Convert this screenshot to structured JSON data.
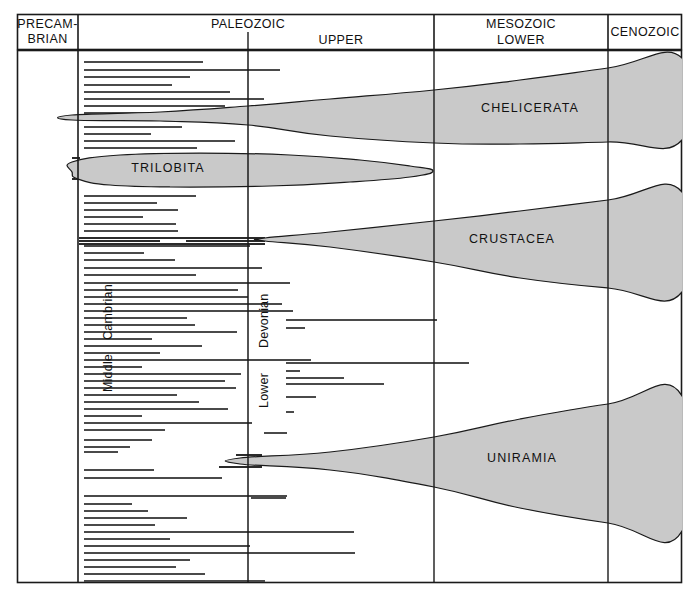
{
  "figure": {
    "background_color": "#ffffff",
    "shape_fill_color": "#c9c9c9",
    "line_color": "#1a1a1a",
    "width": 699,
    "height": 597
  },
  "header": {
    "columns": [
      {
        "name": "precambrian",
        "lines": [
          "PRECAM-",
          "BRIAN"
        ]
      },
      {
        "name": "paleozoic",
        "lines": [
          "PALEOZOIC"
        ]
      },
      {
        "name": "upper",
        "lines": [
          "UPPER"
        ]
      },
      {
        "name": "mesozoic",
        "lines": [
          "MESOZOIC",
          "LOWER"
        ]
      },
      {
        "name": "cenozoic",
        "lines": [
          "CENOZOIC"
        ]
      }
    ]
  },
  "period_labels": [
    {
      "name": "cambrian",
      "text": "Cambrian"
    },
    {
      "name": "middle",
      "text": "Middle"
    },
    {
      "name": "devonian",
      "text": "Devonian"
    },
    {
      "name": "lower",
      "text": "Lower"
    }
  ],
  "taxa": [
    {
      "name": "chelicerata",
      "label": "CHELICERATA"
    },
    {
      "name": "trilobita",
      "label": "TRILOBITA"
    },
    {
      "name": "crustacea",
      "label": "CRUSTACEA"
    },
    {
      "name": "uniramia",
      "label": "UNIRAMIA"
    }
  ],
  "chart_data": {
    "type": "range-chart",
    "xlabel": "",
    "ylabel": "",
    "grid": false,
    "legend": "none",
    "axis_columns": [
      {
        "label": "PRECAMBRIAN",
        "x_start": 17,
        "x_end": 78
      },
      {
        "label": "PALEOZOIC",
        "x_start": 78,
        "x_end": 434
      },
      {
        "label": "UPPER",
        "x_start": 248,
        "x_end": 434
      },
      {
        "label": "MESOZOIC / LOWER",
        "x_start": 434,
        "x_end": 608
      },
      {
        "label": "CENOZOIC",
        "x_start": 608,
        "x_end": 682
      }
    ],
    "vertical_dividers_x": [
      78,
      248,
      434,
      608
    ],
    "taxon_bands": [
      {
        "name": "CHELICERATA",
        "label_x": 530,
        "label_y": 112,
        "description": "Wedge widening from a narrow origin in Cambrian to wide at Cenozoic",
        "outline": [
          [
            72,
            115
          ],
          [
            160,
            112
          ],
          [
            248,
            106
          ],
          [
            330,
            99
          ],
          [
            434,
            90
          ],
          [
            520,
            80
          ],
          [
            608,
            68
          ],
          [
            682,
            58
          ],
          [
            682,
            140
          ],
          [
            608,
            142
          ],
          [
            520,
            144
          ],
          [
            434,
            143
          ],
          [
            330,
            136
          ],
          [
            248,
            125
          ],
          [
            160,
            121
          ],
          [
            72,
            120
          ]
        ]
      },
      {
        "name": "TRILOBITA",
        "label_x": 168,
        "label_y": 172,
        "description": "Lens/leaf shape beginning in Cambrian and tapering out in Upper Paleozoic",
        "outline": [
          [
            72,
            162
          ],
          [
            120,
            155
          ],
          [
            200,
            153
          ],
          [
            290,
            155
          ],
          [
            360,
            160
          ],
          [
            410,
            166
          ],
          [
            433,
            171
          ],
          [
            410,
            177
          ],
          [
            350,
            182
          ],
          [
            270,
            186
          ],
          [
            170,
            187
          ],
          [
            110,
            185
          ],
          [
            78,
            179
          ],
          [
            72,
            172
          ]
        ]
      },
      {
        "name": "CRUSTACEA",
        "label_x": 512,
        "label_y": 243,
        "description": "Wedge originating at a point in Cambrian, widening toward Cenozoic",
        "outline": [
          [
            265,
            238
          ],
          [
            330,
            232
          ],
          [
            434,
            221
          ],
          [
            520,
            211
          ],
          [
            608,
            200
          ],
          [
            682,
            192
          ],
          [
            682,
            292
          ],
          [
            608,
            288
          ],
          [
            520,
            278
          ],
          [
            434,
            262
          ],
          [
            330,
            247
          ],
          [
            265,
            241
          ]
        ]
      },
      {
        "name": "UNIRAMIA",
        "label_x": 522,
        "label_y": 462,
        "description": "Wedge originating near Devonian, broadly expanding to Cenozoic",
        "outline": [
          [
            240,
            458
          ],
          [
            330,
            452
          ],
          [
            434,
            437
          ],
          [
            520,
            419
          ],
          [
            608,
            404
          ],
          [
            682,
            396
          ],
          [
            682,
            531
          ],
          [
            608,
            523
          ],
          [
            520,
            508
          ],
          [
            434,
            487
          ],
          [
            330,
            470
          ],
          [
            240,
            464
          ]
        ]
      }
    ],
    "range_lines": [
      {
        "y": 62,
        "x_start": 84,
        "x_end": 203
      },
      {
        "y": 70,
        "x_start": 84,
        "x_end": 280
      },
      {
        "y": 77,
        "x_start": 84,
        "x_end": 190
      },
      {
        "y": 85,
        "x_start": 84,
        "x_end": 172
      },
      {
        "y": 92,
        "x_start": 84,
        "x_end": 230
      },
      {
        "y": 99,
        "x_start": 84,
        "x_end": 264
      },
      {
        "y": 106,
        "x_start": 84,
        "x_end": 225
      },
      {
        "y": 113,
        "x_start": 84,
        "x_end": 250
      },
      {
        "y": 127,
        "x_start": 84,
        "x_end": 182
      },
      {
        "y": 134,
        "x_start": 84,
        "x_end": 151
      },
      {
        "y": 141,
        "x_start": 84,
        "x_end": 235
      },
      {
        "y": 148,
        "x_start": 84,
        "x_end": 197
      },
      {
        "y": 196,
        "x_start": 84,
        "x_end": 196
      },
      {
        "y": 203,
        "x_start": 84,
        "x_end": 157
      },
      {
        "y": 210,
        "x_start": 84,
        "x_end": 178
      },
      {
        "y": 217,
        "x_start": 84,
        "x_end": 143
      },
      {
        "y": 224,
        "x_start": 84,
        "x_end": 176
      },
      {
        "y": 231,
        "x_start": 84,
        "x_end": 178
      },
      {
        "y": 246,
        "x_start": 84,
        "x_end": 250
      },
      {
        "y": 253,
        "x_start": 84,
        "x_end": 144
      },
      {
        "y": 260,
        "x_start": 84,
        "x_end": 175
      },
      {
        "y": 268,
        "x_start": 84,
        "x_end": 262
      },
      {
        "y": 275,
        "x_start": 84,
        "x_end": 196
      },
      {
        "y": 283,
        "x_start": 84,
        "x_end": 290
      },
      {
        "y": 290,
        "x_start": 84,
        "x_end": 238
      },
      {
        "y": 297,
        "x_start": 84,
        "x_end": 248
      },
      {
        "y": 304,
        "x_start": 84,
        "x_end": 282
      },
      {
        "y": 311,
        "x_start": 84,
        "x_end": 293
      },
      {
        "y": 318,
        "x_start": 84,
        "x_end": 187
      },
      {
        "y": 320,
        "x_start": 286,
        "x_end": 437
      },
      {
        "y": 325,
        "x_start": 84,
        "x_end": 195
      },
      {
        "y": 328,
        "x_start": 286,
        "x_end": 305
      },
      {
        "y": 332,
        "x_start": 84,
        "x_end": 237
      },
      {
        "y": 339,
        "x_start": 84,
        "x_end": 152
      },
      {
        "y": 346,
        "x_start": 84,
        "x_end": 202
      },
      {
        "y": 353,
        "x_start": 84,
        "x_end": 160
      },
      {
        "y": 360,
        "x_start": 84,
        "x_end": 311
      },
      {
        "y": 363,
        "x_start": 286,
        "x_end": 469
      },
      {
        "y": 367,
        "x_start": 84,
        "x_end": 142
      },
      {
        "y": 371,
        "x_start": 286,
        "x_end": 300
      },
      {
        "y": 374,
        "x_start": 84,
        "x_end": 241
      },
      {
        "y": 378,
        "x_start": 286,
        "x_end": 344
      },
      {
        "y": 381,
        "x_start": 84,
        "x_end": 225
      },
      {
        "y": 384,
        "x_start": 286,
        "x_end": 384
      },
      {
        "y": 388,
        "x_start": 84,
        "x_end": 236
      },
      {
        "y": 395,
        "x_start": 84,
        "x_end": 177
      },
      {
        "y": 397,
        "x_start": 286,
        "x_end": 316
      },
      {
        "y": 402,
        "x_start": 84,
        "x_end": 199
      },
      {
        "y": 409,
        "x_start": 84,
        "x_end": 228
      },
      {
        "y": 412,
        "x_start": 286,
        "x_end": 294
      },
      {
        "y": 416,
        "x_start": 84,
        "x_end": 142
      },
      {
        "y": 423,
        "x_start": 84,
        "x_end": 252
      },
      {
        "y": 430,
        "x_start": 84,
        "x_end": 165
      },
      {
        "y": 433,
        "x_start": 264,
        "x_end": 287
      },
      {
        "y": 440,
        "x_start": 84,
        "x_end": 152
      },
      {
        "y": 447,
        "x_start": 84,
        "x_end": 130
      },
      {
        "y": 452,
        "x_start": 84,
        "x_end": 118
      },
      {
        "y": 470,
        "x_start": 84,
        "x_end": 154
      },
      {
        "y": 478,
        "x_start": 84,
        "x_end": 222
      },
      {
        "y": 496,
        "x_start": 84,
        "x_end": 287
      },
      {
        "y": 498,
        "x_start": 251,
        "x_end": 286
      },
      {
        "y": 504,
        "x_start": 84,
        "x_end": 132
      },
      {
        "y": 511,
        "x_start": 84,
        "x_end": 148
      },
      {
        "y": 518,
        "x_start": 84,
        "x_end": 187
      },
      {
        "y": 525,
        "x_start": 84,
        "x_end": 155
      },
      {
        "y": 532,
        "x_start": 84,
        "x_end": 354
      },
      {
        "y": 539,
        "x_start": 84,
        "x_end": 170
      },
      {
        "y": 546,
        "x_start": 84,
        "x_end": 250
      },
      {
        "y": 553,
        "x_start": 84,
        "x_end": 355
      },
      {
        "y": 560,
        "x_start": 84,
        "x_end": 190
      },
      {
        "y": 567,
        "x_start": 84,
        "x_end": 176
      },
      {
        "y": 574,
        "x_start": 84,
        "x_end": 205
      },
      {
        "y": 581,
        "x_start": 84,
        "x_end": 265
      }
    ],
    "heavy_range_lines": [
      {
        "y": 238,
        "x_start": 79,
        "x_end": 265
      },
      {
        "y": 241,
        "x_start": 79,
        "x_end": 160
      },
      {
        "y": 241,
        "x_start": 186,
        "x_end": 265
      },
      {
        "y": 244,
        "x_start": 79,
        "x_end": 265
      },
      {
        "y": 455,
        "x_start": 236,
        "x_end": 262
      },
      {
        "y": 459,
        "x_start": 236,
        "x_end": 262
      },
      {
        "y": 463,
        "x_start": 236,
        "x_end": 262
      },
      {
        "y": 467,
        "x_start": 219,
        "x_end": 262
      }
    ],
    "dashed_lines": [
      {
        "y": 116,
        "x_start": 106,
        "x_end": 258
      }
    ],
    "precambrian_ticks": [
      {
        "y": 158,
        "x_start": 72,
        "x_end": 80
      },
      {
        "y": 165,
        "x_start": 72,
        "x_end": 80
      },
      {
        "y": 172,
        "x_start": 72,
        "x_end": 80
      },
      {
        "y": 179,
        "x_start": 72,
        "x_end": 80
      }
    ]
  }
}
